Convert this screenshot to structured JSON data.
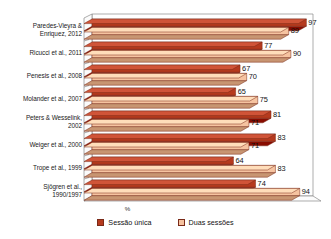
{
  "chart_data": {
    "type": "bar",
    "orientation": "horizontal",
    "title": "",
    "xlabel": "%",
    "ylabel": "",
    "xlim": [
      0,
      100
    ],
    "grid": false,
    "legend_position": "bottom",
    "categories": [
      "Paredes-Vieyra & Enriquez, 2012",
      "Ricucci et al., 2011",
      "Penesis et al., 2008",
      "Molander et al., 2007",
      "Peters & Wesselink, 2002",
      "Weiger et al., 2000",
      "Trope et al., 1999",
      "Sjögren et al., 1990/1997"
    ],
    "category_lines": [
      [
        "Paredes-Vieyra &",
        "Enriquez, 2012"
      ],
      [
        "Ricucci et al., 2011"
      ],
      [
        "Penesis et al., 2008"
      ],
      [
        "Molander et al., 2007"
      ],
      [
        "Peters & Wesselink,",
        "2002"
      ],
      [
        "Weiger et al., 2000"
      ],
      [
        "Trope et al., 1999"
      ],
      [
        "Sjögren et al.,",
        "1990/1997"
      ]
    ],
    "series": [
      {
        "name": "Sessão única",
        "color": "#b63a1e",
        "values": [
          97,
          77,
          67,
          65,
          81,
          83,
          64,
          74
        ]
      },
      {
        "name": "Duas sessões",
        "color": "#f6c3a0",
        "values": [
          89,
          90,
          70,
          75,
          71,
          71,
          83,
          94
        ]
      }
    ]
  },
  "axis": {
    "x_title": "%"
  },
  "legend": {
    "items": [
      {
        "label": "Sessão única",
        "color": "#b63a1e"
      },
      {
        "label": "Duas sessões",
        "color": "#f6c3a0"
      }
    ]
  }
}
